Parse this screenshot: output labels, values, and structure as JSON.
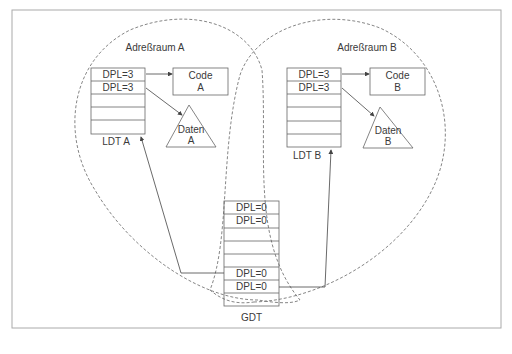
{
  "diagram": {
    "address_space_a": {
      "title": "Adreßraum A",
      "ldt": {
        "label": "LDT A",
        "rows": [
          "DPL=3",
          "DPL=3",
          "",
          "",
          ""
        ]
      },
      "code": {
        "line1": "Code",
        "line2": "A"
      },
      "data": {
        "line1": "Daten",
        "line2": "A"
      }
    },
    "address_space_b": {
      "title": "Adreßraum B",
      "ldt": {
        "label": "LDT B",
        "rows": [
          "DPL=3",
          "DPL=3",
          "",
          "",
          "",
          ""
        ]
      },
      "code": {
        "line1": "Code",
        "line2": "B"
      },
      "data": {
        "line1": "Daten",
        "line2": "B"
      }
    },
    "gdt": {
      "label": "GDT",
      "rows": [
        "DPL=0",
        "DPL=0",
        "",
        "",
        "",
        "DPL=0",
        "DPL=0",
        ""
      ]
    },
    "colors": {
      "line": "#555555",
      "frame": "#999999",
      "text": "#3a3a3a"
    }
  }
}
